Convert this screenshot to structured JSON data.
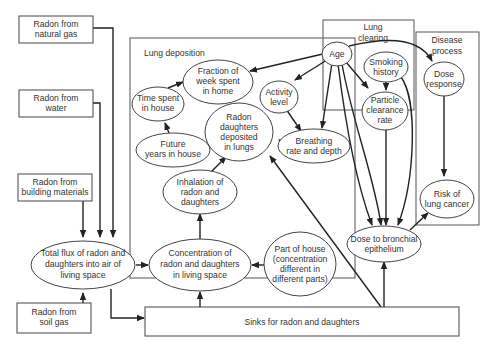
{
  "diagram": {
    "groups": {
      "lung_deposition": "Lung deposition",
      "lung_clearing": [
        "Lung",
        "clearing"
      ],
      "disease_process": [
        "Disease",
        "process"
      ]
    },
    "sources": {
      "natural_gas": [
        "Radon from",
        "natural gas"
      ],
      "water": [
        "Radon from",
        "water"
      ],
      "building_materials": [
        "Radon from",
        "building materials"
      ],
      "soil_gas": [
        "Radon from",
        "soil gas"
      ]
    },
    "nodes": {
      "total_flux": [
        "Total flux of radon and",
        "daughters into air of",
        "living space"
      ],
      "concentration": [
        "Concentration of",
        "radon and daughters",
        "in living space"
      ],
      "part_of_house": [
        "Part of house",
        "(concentration",
        "different in",
        "different parts)"
      ],
      "sinks": "Sinks for radon and daughters",
      "inhalation": [
        "Inhalation of",
        "radon and",
        "daughters"
      ],
      "future_years": [
        "Future",
        "years in house"
      ],
      "time_spent": [
        "Time spent",
        "in house"
      ],
      "fraction_week": [
        "Fraction of",
        "week spent",
        "in home"
      ],
      "radon_deposited": [
        "Radon",
        "daughters",
        "deposited",
        "in lungs"
      ],
      "activity_level": [
        "Activity",
        "level"
      ],
      "breathing": [
        "Breathing",
        "rate and depth"
      ],
      "age": "Age",
      "smoking": [
        "Smoking",
        "history"
      ],
      "particle_clearance": [
        "Particle",
        "clearance",
        "rate"
      ],
      "dose_response": [
        "Dose",
        "response"
      ],
      "risk": [
        "Risk of",
        "lung cancer"
      ],
      "dose_bronchial": [
        "Dose to bronchial",
        "epithelium"
      ]
    },
    "edges": [
      {
        "from": "Radon from natural gas",
        "to": "Total flux of radon and daughters into air of living space"
      },
      {
        "from": "Radon from water",
        "to": "Total flux of radon and daughters into air of living space"
      },
      {
        "from": "Radon from building materials",
        "to": "Total flux of radon and daughters into air of living space"
      },
      {
        "from": "Radon from soil gas",
        "to": "Total flux of radon and daughters into air of living space"
      },
      {
        "from": "Total flux of radon and daughters into air of living space",
        "to": "Concentration of radon and daughters in living space"
      },
      {
        "from": "Total flux of radon and daughters into air of living space",
        "to": "Sinks for radon and daughters"
      },
      {
        "from": "Part of house",
        "to": "Concentration of radon and daughters in living space"
      },
      {
        "from": "Sinks for radon and daughters",
        "to": "Concentration of radon and daughters in living space"
      },
      {
        "from": "Concentration of radon and daughters in living space",
        "to": "Inhalation of radon and daughters"
      },
      {
        "from": "Inhalation of radon and daughters",
        "to": "Radon daughters deposited in lungs"
      },
      {
        "from": "Future years in house",
        "to": "Time spent in house"
      },
      {
        "from": "Time spent in house",
        "to": "Fraction of week spent in home"
      },
      {
        "from": "Age",
        "to": "Fraction of week spent in home"
      },
      {
        "from": "Age",
        "to": "Activity level"
      },
      {
        "from": "Age",
        "to": "Breathing rate and depth"
      },
      {
        "from": "Age",
        "to": "Particle clearance rate"
      },
      {
        "from": "Age",
        "to": "Dose response"
      },
      {
        "from": "Age",
        "to": "Dose to bronchial epithelium"
      },
      {
        "from": "Activity level",
        "to": "Breathing rate and depth"
      },
      {
        "from": "Breathing rate and depth",
        "to": "Radon daughters deposited in lungs"
      },
      {
        "from": "Smoking history",
        "to": "Particle clearance rate"
      },
      {
        "from": "Smoking history",
        "to": "Dose to bronchial epithelium"
      },
      {
        "from": "Particle clearance rate",
        "to": "Dose to bronchial epithelium"
      },
      {
        "from": "Sinks for radon and daughters",
        "to": "Radon daughters deposited in lungs"
      },
      {
        "from": "Sinks for radon and daughters",
        "to": "Dose to bronchial epithelium"
      },
      {
        "from": "Dose response",
        "to": "Risk of lung cancer"
      },
      {
        "from": "Dose to bronchial epithelium",
        "to": "Risk of lung cancer"
      }
    ]
  }
}
